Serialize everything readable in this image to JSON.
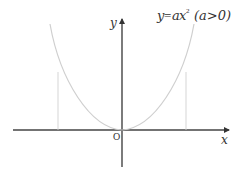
{
  "diagram": {
    "equation": {
      "y": "y",
      "eq": "=",
      "a": "a",
      "x": "x",
      "exp": "2",
      "condition": "(a>0)"
    },
    "axes": {
      "x_label": "x",
      "y_label": "y",
      "origin_label": "O"
    },
    "colors": {
      "axis": "#333333",
      "curve": "#cccccc",
      "guide": "#cccccc",
      "text": "#333333"
    }
  }
}
